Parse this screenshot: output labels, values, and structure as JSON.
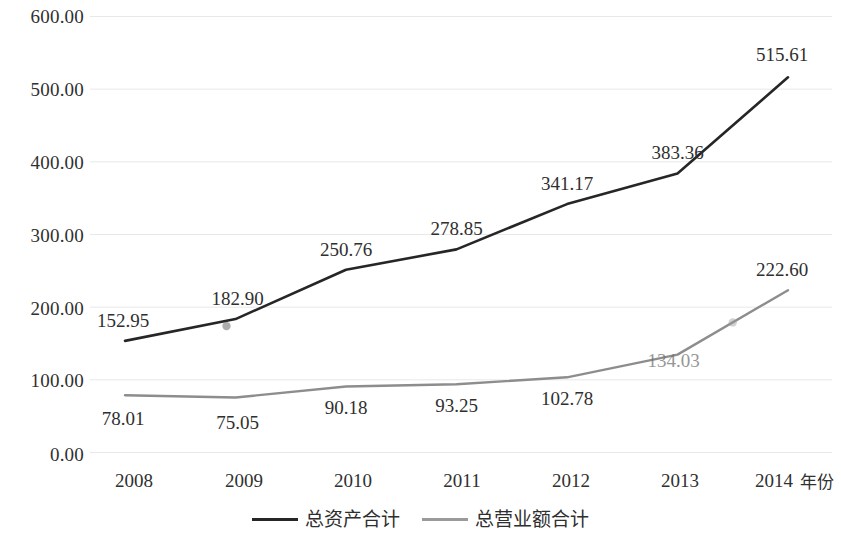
{
  "chart_data": {
    "type": "line",
    "title": "",
    "subtitle": "",
    "xlabel": "年份",
    "ylabel": "",
    "x": [
      "2008",
      "2009",
      "2010",
      "2011",
      "2012",
      "2013",
      "2014"
    ],
    "categories": [
      "2008",
      "2009",
      "2010",
      "2011",
      "2012",
      "2013",
      "2014"
    ],
    "series": [
      {
        "name": "总资产合计",
        "color": "#262626",
        "values": [
          152.95,
          182.9,
          250.76,
          278.85,
          341.17,
          383.36,
          515.61
        ],
        "labels": [
          "152.95",
          "182.90",
          "250.76",
          "278.85",
          "341.17",
          "383.36",
          "515.61"
        ],
        "label_faded": [
          false,
          false,
          false,
          false,
          false,
          false,
          false
        ]
      },
      {
        "name": "总营业额合计",
        "color": "#8d8d8d",
        "values": [
          78.01,
          75.05,
          90.18,
          93.25,
          102.78,
          134.03,
          222.6
        ],
        "labels": [
          "78.01",
          "75.05",
          "90.18",
          "93.25",
          "102.78",
          "134.03",
          "222.60"
        ],
        "label_faded": [
          false,
          false,
          false,
          false,
          false,
          true,
          false
        ]
      }
    ],
    "y_ticks": [
      "0.00",
      "100.00",
      "200.00",
      "300.00",
      "400.00",
      "500.00",
      "600.00"
    ],
    "y_tick_values": [
      0,
      100,
      200,
      300,
      400,
      500,
      600
    ],
    "ylim": [
      0,
      600
    ],
    "grid": true,
    "grid_axis": "y",
    "grid_color": "#e8e8e8",
    "legend_position": "bottom",
    "legend_entries": [
      "总资产合计",
      "总营业额合计"
    ],
    "markers": {
      "series_0": [
        {
          "x": "2009",
          "y": 182.9
        }
      ],
      "series_1": [
        {
          "x": "2013.5",
          "y": 180.0
        }
      ]
    },
    "background_color": "#ffffff"
  }
}
